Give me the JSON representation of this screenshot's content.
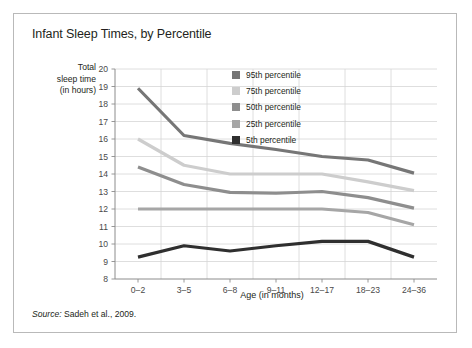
{
  "figure": {
    "title": "Infant Sleep Times, by Percentile",
    "source": {
      "label": "Source:",
      "text": " Sadeh et al., 2009."
    }
  },
  "chart_data": {
    "type": "line",
    "title": "Infant Sleep Times, by Percentile",
    "xlabel": "Age (in months)",
    "ylabel": "Total sleep time (in hours)",
    "ylabel_lines": [
      "Total",
      "sleep time",
      "(in hours)"
    ],
    "categories": [
      "0–2",
      "3–5",
      "6–8",
      "9–11",
      "12–17",
      "18–23",
      "24–36"
    ],
    "ylim": [
      8,
      20
    ],
    "yticks": [
      8,
      9,
      10,
      11,
      12,
      13,
      14,
      15,
      16,
      17,
      18,
      19,
      20
    ],
    "grid": true,
    "legend_position": "top-right",
    "series": [
      {
        "name": "95th percentile",
        "color": "#767676",
        "values": [
          18.9,
          16.2,
          15.75,
          15.4,
          15.0,
          14.8,
          14.05
        ]
      },
      {
        "name": "75th percentile",
        "color": "#cdcdcd",
        "values": [
          16.0,
          14.5,
          14.0,
          14.0,
          14.0,
          13.55,
          13.05
        ]
      },
      {
        "name": "50th percentile",
        "color": "#8e8e8e",
        "values": [
          14.4,
          13.4,
          12.95,
          12.9,
          13.0,
          12.65,
          12.05
        ]
      },
      {
        "name": "25th percentile",
        "color": "#a6a6a6",
        "values": [
          12.0,
          12.0,
          12.0,
          12.0,
          12.0,
          11.8,
          11.1
        ]
      },
      {
        "name": "5th percentile",
        "color": "#2f2f2f",
        "values": [
          9.25,
          9.9,
          9.6,
          9.9,
          10.15,
          10.15,
          9.25
        ]
      }
    ]
  },
  "style": {
    "grid_color": "#d6d6d6",
    "axis_color": "#8c8c8c",
    "tick_label_color": "#4a4a4a",
    "border_color": "#b9b9b9"
  }
}
